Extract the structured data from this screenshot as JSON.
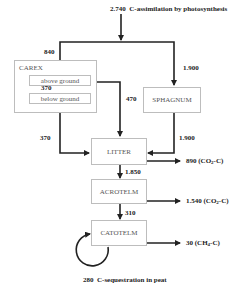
{
  "top": {
    "value": "2.740",
    "text": "C-assimilation by photosynthesis"
  },
  "boxes": {
    "carex": "CAREX",
    "above_ground": "above ground",
    "below_ground": "below ground",
    "sphagnum": "SPHAGNUM",
    "litter": "LITTER",
    "acrotelm": "ACROTELM",
    "catotelm": "CATOTELM"
  },
  "flows": {
    "to_carex": "840",
    "to_sphagnum": "1.900",
    "above_to_below": "370",
    "above_to_litter": "470",
    "carex_to_litter": "370",
    "sphagnum_to_litter": "1.900",
    "litter_to_acrotelm": "1.850",
    "acrotelm_to_catotelm": "310"
  },
  "outputs": {
    "litter": {
      "value": "890",
      "gas": "(CO",
      "sub": "2",
      "suffix": "-C)"
    },
    "acrotelm": {
      "value": "1.540",
      "gas": "(CO",
      "sub": "2",
      "suffix": "-C)"
    },
    "catotelm": {
      "value": "30",
      "gas": "(CH",
      "sub": "4",
      "suffix": "-C)"
    }
  },
  "sequestration": {
    "value": "280",
    "text": "C-sequestration in peat"
  },
  "colors": {
    "line": "#222222",
    "box_border": "#bdbdbd",
    "box_text": "#555555"
  }
}
